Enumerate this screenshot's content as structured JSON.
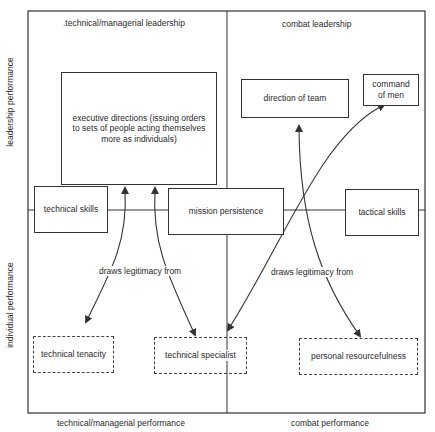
{
  "axes": {
    "y_top": "leadership performance",
    "y_bottom": "individual performance",
    "x_left": "technical/managerial performance",
    "x_right": "combat performance"
  },
  "quadrant_headers": {
    "left": ".technical/managerial leadership",
    "right": "combat leadership"
  },
  "boxes": {
    "executive_directions": "executive directions (issuing orders to sets of people acting themselves more as individuals)",
    "direction_of_team": "direction of team",
    "command_of_men": "command of men",
    "technical_skills": "technical skills",
    "mission_persistence": "mission persistence",
    "tactical_skills": "tactical skills",
    "technical_tenacity": "technical tenacity",
    "technical_specialist": "technical specialist",
    "personal_resourcefulness": "personal resourcefulness"
  },
  "edge_labels": {
    "left": "draws legitimacy from",
    "right": "draws legitimacy from"
  },
  "colors": {
    "line": "#333333",
    "background": "#ffffff"
  }
}
